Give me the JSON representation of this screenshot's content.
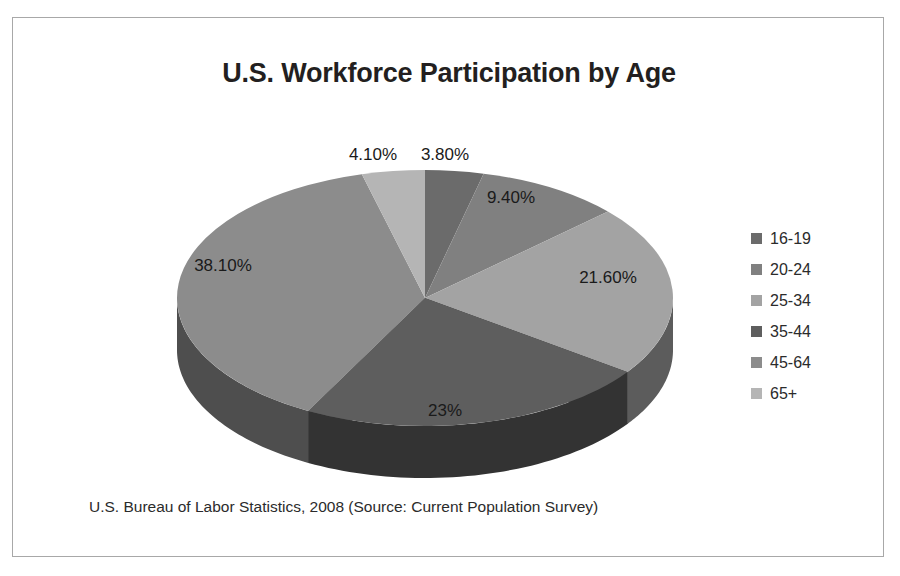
{
  "chart_data": {
    "type": "pie",
    "title": "U.S. Workforce Participation by Age",
    "subtitle": "",
    "xlabel": "",
    "ylabel": "",
    "legend_position": "right",
    "grid": false,
    "three_d": true,
    "categories": [
      "16-19",
      "20-24",
      "25-34",
      "35-44",
      "45-64",
      "65+"
    ],
    "values": [
      3.8,
      9.4,
      21.6,
      23.0,
      38.1,
      4.1
    ],
    "value_labels": [
      "3.80%",
      "9.40%",
      "21.60%",
      "23%",
      "38.10%",
      "4.10%"
    ],
    "colors": [
      "#6b6b6b",
      "#808080",
      "#a3a3a3",
      "#5e5e5e",
      "#8c8c8c",
      "#b5b5b5"
    ],
    "side_colors": [
      "#3a3a3a",
      "#454545",
      "#5c5c5c",
      "#333333",
      "#4e4e4e",
      "#666666"
    ],
    "annotations": [
      "U.S. Bureau of Labor Statistics, 2008 (Source: Current Population Survey)"
    ]
  },
  "title": "U.S. Workforce Participation by Age",
  "legend": {
    "items": [
      {
        "label": "16-19",
        "color": "#6b6b6b"
      },
      {
        "label": "20-24",
        "color": "#808080"
      },
      {
        "label": "25-34",
        "color": "#a3a3a3"
      },
      {
        "label": "35-44",
        "color": "#5e5e5e"
      },
      {
        "label": "45-64",
        "color": "#8c8c8c"
      },
      {
        "label": "65+",
        "color": "#b5b5b5"
      }
    ]
  },
  "labels": {
    "s0": "3.80%",
    "s1": "9.40%",
    "s2": "21.60%",
    "s3": "23%",
    "s4": "38.10%",
    "s5": "4.10%"
  },
  "footnote": "U.S. Bureau of Labor Statistics, 2008 (Source: Current Population Survey)"
}
